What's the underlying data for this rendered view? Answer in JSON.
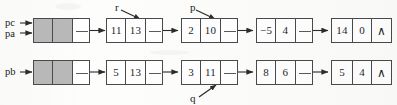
{
  "figure": {
    "kind": "linked-list-diagram",
    "null_symbol": "∧",
    "colors": {
      "ink": "#1f1f1f",
      "border": "#4a4a4a",
      "shaded_cell": "#b9b9b9",
      "paper": "#fdfdfc"
    }
  },
  "pointer_labels": {
    "pc": "pc",
    "pa": "pa",
    "pb": "pb",
    "r": "r",
    "p": "p",
    "q": "q"
  },
  "rows": [
    {
      "id": "row-a",
      "head_labels": [
        "pc",
        "pa"
      ],
      "nodes": [
        {
          "id": "a-head",
          "type": "header-node",
          "cells": [
            {
              "text": "",
              "style": "shaded"
            },
            {
              "text": "",
              "style": "shaded"
            },
            {
              "text": "",
              "style": "pointer"
            }
          ]
        },
        {
          "id": "a-1",
          "type": "data-node",
          "cells": [
            {
              "text": "11",
              "style": "value"
            },
            {
              "text": "13",
              "style": "value"
            },
            {
              "text": "",
              "style": "pointer"
            }
          ]
        },
        {
          "id": "a-2",
          "type": "data-node",
          "cells": [
            {
              "text": "2",
              "style": "value"
            },
            {
              "text": "10",
              "style": "value"
            },
            {
              "text": "",
              "style": "pointer"
            }
          ]
        },
        {
          "id": "a-3",
          "type": "data-node",
          "cells": [
            {
              "text": "−5",
              "style": "value"
            },
            {
              "text": "4",
              "style": "value"
            },
            {
              "text": "",
              "style": "pointer"
            }
          ]
        },
        {
          "id": "a-4",
          "type": "data-node",
          "cells": [
            {
              "text": "14",
              "style": "value"
            },
            {
              "text": "0",
              "style": "value"
            },
            {
              "text": "∧",
              "style": "null"
            }
          ]
        }
      ]
    },
    {
      "id": "row-b",
      "head_labels": [
        "pb"
      ],
      "nodes": [
        {
          "id": "b-head",
          "type": "header-node",
          "cells": [
            {
              "text": "",
              "style": "shaded"
            },
            {
              "text": "",
              "style": "shaded"
            },
            {
              "text": "",
              "style": "pointer"
            }
          ]
        },
        {
          "id": "b-1",
          "type": "data-node",
          "cells": [
            {
              "text": "5",
              "style": "value"
            },
            {
              "text": "13",
              "style": "value"
            },
            {
              "text": "",
              "style": "pointer"
            }
          ]
        },
        {
          "id": "b-2",
          "type": "data-node",
          "cells": [
            {
              "text": "3",
              "style": "value"
            },
            {
              "text": "11",
              "style": "value"
            },
            {
              "text": "",
              "style": "pointer"
            }
          ]
        },
        {
          "id": "b-3",
          "type": "data-node",
          "cells": [
            {
              "text": "8",
              "style": "value"
            },
            {
              "text": "6",
              "style": "value"
            },
            {
              "text": "",
              "style": "pointer"
            }
          ]
        },
        {
          "id": "b-4",
          "type": "data-node",
          "cells": [
            {
              "text": "5",
              "style": "value"
            },
            {
              "text": "4",
              "style": "value"
            },
            {
              "text": "∧",
              "style": "null"
            }
          ]
        }
      ]
    }
  ],
  "annotations": [
    {
      "label": "r",
      "points_to": "a-1",
      "direction": "down-right"
    },
    {
      "label": "p",
      "points_to": "a-2",
      "direction": "down-right"
    },
    {
      "label": "q",
      "points_to": "b-2",
      "direction": "up-right"
    }
  ]
}
